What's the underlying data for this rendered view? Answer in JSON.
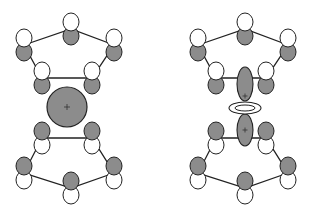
{
  "diagram": {
    "colors": {
      "lobe_shaded": "#8c8c8c",
      "lobe_unshaded": "#ffffff",
      "stroke": "#222222",
      "bond": "#222222"
    },
    "figures": [
      {
        "id": "left",
        "metal_orbital": "s-type (spherical)",
        "metal_orbital_sign": "+"
      },
      {
        "id": "right",
        "metal_orbital": "dz2-type (lobes with torus)",
        "metal_orbital_sign_top": "+",
        "metal_orbital_sign_bottom": "+"
      }
    ]
  }
}
